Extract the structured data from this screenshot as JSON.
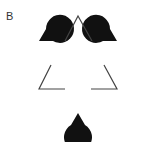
{
  "figure": {
    "panel_label": "B",
    "colors": {
      "inducer": "#111111",
      "outline": "#444444",
      "background": "#ffffff"
    },
    "inducers": [
      {
        "name": "left",
        "cx": 39,
        "cy": 41,
        "r": 14,
        "mouth_deg": 30
      },
      {
        "name": "right",
        "cx": 117,
        "cy": 41,
        "r": 14,
        "mouth_deg": 150
      },
      {
        "name": "bottom",
        "cx": 78,
        "cy": 113,
        "r": 14,
        "mouth_deg": 270
      }
    ],
    "outline_corners": [
      {
        "name": "top",
        "points": [
          [
            65,
            41
          ],
          [
            78,
            16
          ],
          [
            92,
            41
          ]
        ]
      },
      {
        "name": "bottom-left",
        "points": [
          [
            51,
            65
          ],
          [
            39,
            89
          ],
          [
            65,
            89
          ]
        ]
      },
      {
        "name": "bottom-right",
        "points": [
          [
            104,
            65
          ],
          [
            117,
            89
          ],
          [
            91,
            89
          ]
        ]
      }
    ]
  }
}
